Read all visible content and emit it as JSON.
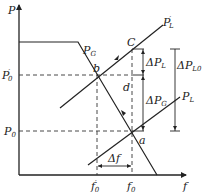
{
  "diagram": {
    "axes": {
      "y_label": "P",
      "x_label": "f"
    },
    "curves": {
      "generator": {
        "label": "P",
        "sub": "G"
      },
      "load_new": {
        "label": "P",
        "sub": "L",
        "prime": "′"
      },
      "load_orig": {
        "label": "P",
        "sub": "L"
      }
    },
    "points": {
      "a": "a",
      "b": "b",
      "c": "C",
      "d": "d"
    },
    "y_ticks": {
      "p0_prime": {
        "label": "P",
        "sub": "0",
        "prime": "′"
      },
      "p0": {
        "label": "P",
        "sub": "0"
      }
    },
    "x_ticks": {
      "f0_prime": {
        "label": "f",
        "sub": "0",
        "prime": "′"
      },
      "f0": {
        "label": "f",
        "sub": "0"
      }
    },
    "annotations": {
      "delta_pl": {
        "label": "ΔP",
        "sub": "L"
      },
      "delta_pg": {
        "label": "ΔP",
        "sub": "G"
      },
      "delta_pl0": {
        "label": "ΔP",
        "sub": "L0"
      },
      "delta_f": {
        "label": "Δf"
      }
    },
    "colors": {
      "line": "#222222",
      "background": "#ffffff"
    }
  }
}
